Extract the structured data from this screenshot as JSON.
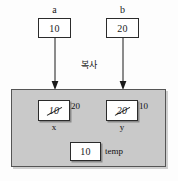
{
  "diagram": {
    "copy_caption": "복사",
    "colors": {
      "scope_fill": "#c9c9c9",
      "scope_border": "#555555",
      "box_fill": "#ffffff",
      "box_border": "#2b2b2b",
      "text": "#1a1a1a"
    },
    "outer_variables": [
      {
        "name": "a",
        "value": "10"
      },
      {
        "name": "b",
        "value": "20"
      }
    ],
    "arrows": [
      {
        "name": "arrow-a-to-x",
        "from": "a",
        "to": "x",
        "direction": "down"
      },
      {
        "name": "arrow-b-to-y",
        "from": "b",
        "to": "y",
        "direction": "down"
      }
    ],
    "scope_variables": [
      {
        "name": "x",
        "initial_value": "10",
        "initial_struck": true,
        "new_value": "20"
      },
      {
        "name": "y",
        "initial_value": "20",
        "initial_struck": true,
        "new_value": "10"
      },
      {
        "name": "temp",
        "initial_value": "10",
        "initial_struck": false,
        "new_value": ""
      }
    ]
  }
}
